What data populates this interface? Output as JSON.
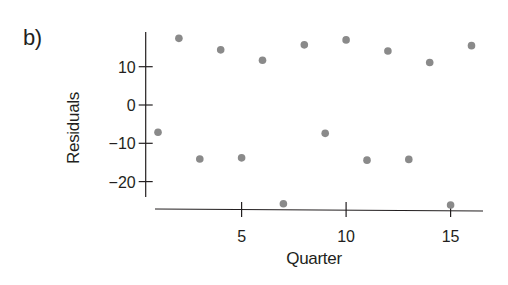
{
  "panel_label": "b)",
  "chart_data": {
    "type": "scatter",
    "title": "",
    "xlabel": "Quarter",
    "ylabel": "Residuals",
    "x": [
      1,
      2,
      3,
      4,
      5,
      6,
      7,
      8,
      9,
      10,
      11,
      12,
      13,
      14,
      15,
      16
    ],
    "y": [
      -7.1,
      17.4,
      -14.1,
      14.4,
      -13.8,
      11.7,
      -25.8,
      15.7,
      -7.4,
      17.0,
      -14.4,
      14.1,
      -14.2,
      11.1,
      -26.1,
      15.5
    ],
    "xticks": [
      5,
      10,
      15
    ],
    "xtick_labels": [
      "5",
      "10",
      "15"
    ],
    "yticks": [
      10,
      0,
      -10,
      -20
    ],
    "ytick_labels": [
      "10",
      "0",
      "−10",
      "−20"
    ],
    "xlim": [
      0.85,
      16.5
    ],
    "ylim": [
      -24,
      19
    ],
    "grid": false,
    "legend": null,
    "marker_color": "#8a8a8a",
    "axis_color": "#231f20"
  }
}
